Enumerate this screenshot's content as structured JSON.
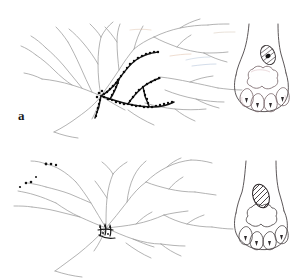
{
  "figure": {
    "type": "scientific-line-drawing",
    "background_color": "#ffffff",
    "width": 296,
    "height": 278
  },
  "panels": [
    {
      "id": "a",
      "label": "a",
      "label_position": {
        "x": 18,
        "y": 109
      },
      "arbor": {
        "name": "terminal-arborization-a",
        "unlabeled_branch_color": "#9a9a9a",
        "labeled_branch_color": "#111111",
        "labeled_segments": 6,
        "varicosity_count": 96,
        "convergence_point": {
          "x": 101,
          "y": 96
        },
        "tint_artifacts": [
          "#b8c6d8",
          "#d8b89a"
        ]
      },
      "inset": {
        "name": "paw-inset-a",
        "outline_color": "#4a4446",
        "pad_outline_color": "#6b5a5e",
        "palm_pad_lobes": 4,
        "digit_pads": 4,
        "receptive_field": {
          "shape": "oval",
          "fill": "hatched",
          "hatch_color": "#4a4446",
          "center": {
            "x": 268,
            "y": 55
          },
          "rx": 7,
          "ry": 10,
          "rotation_deg": -22,
          "focal_spot": true,
          "focal_spot_color": "#1a1a1a"
        }
      }
    },
    {
      "id": "b",
      "label": "b",
      "label_position": {
        "x": 18,
        "y": 248
      },
      "arbor": {
        "name": "terminal-arborization-b",
        "unlabeled_branch_color": "#9a9a9a",
        "labeled_branch_color": "#111111",
        "labeled_segments": 0,
        "terminal_dot_count": 7,
        "convergence_point": {
          "x": 106,
          "y": 228
        },
        "tint_artifacts": []
      },
      "inset": {
        "name": "paw-inset-b",
        "outline_color": "#4a4446",
        "pad_outline_color": "#4a4446",
        "palm_pad_lobes": 4,
        "digit_pads": 4,
        "receptive_field": {
          "shape": "oval",
          "fill": "hatched",
          "hatch_color": "#2a2426",
          "center": {
            "x": 261,
            "y": 196
          },
          "rx": 8,
          "ry": 12,
          "rotation_deg": -18,
          "focal_spot": false,
          "focal_spot_color": "#1a1a1a"
        }
      }
    }
  ]
}
